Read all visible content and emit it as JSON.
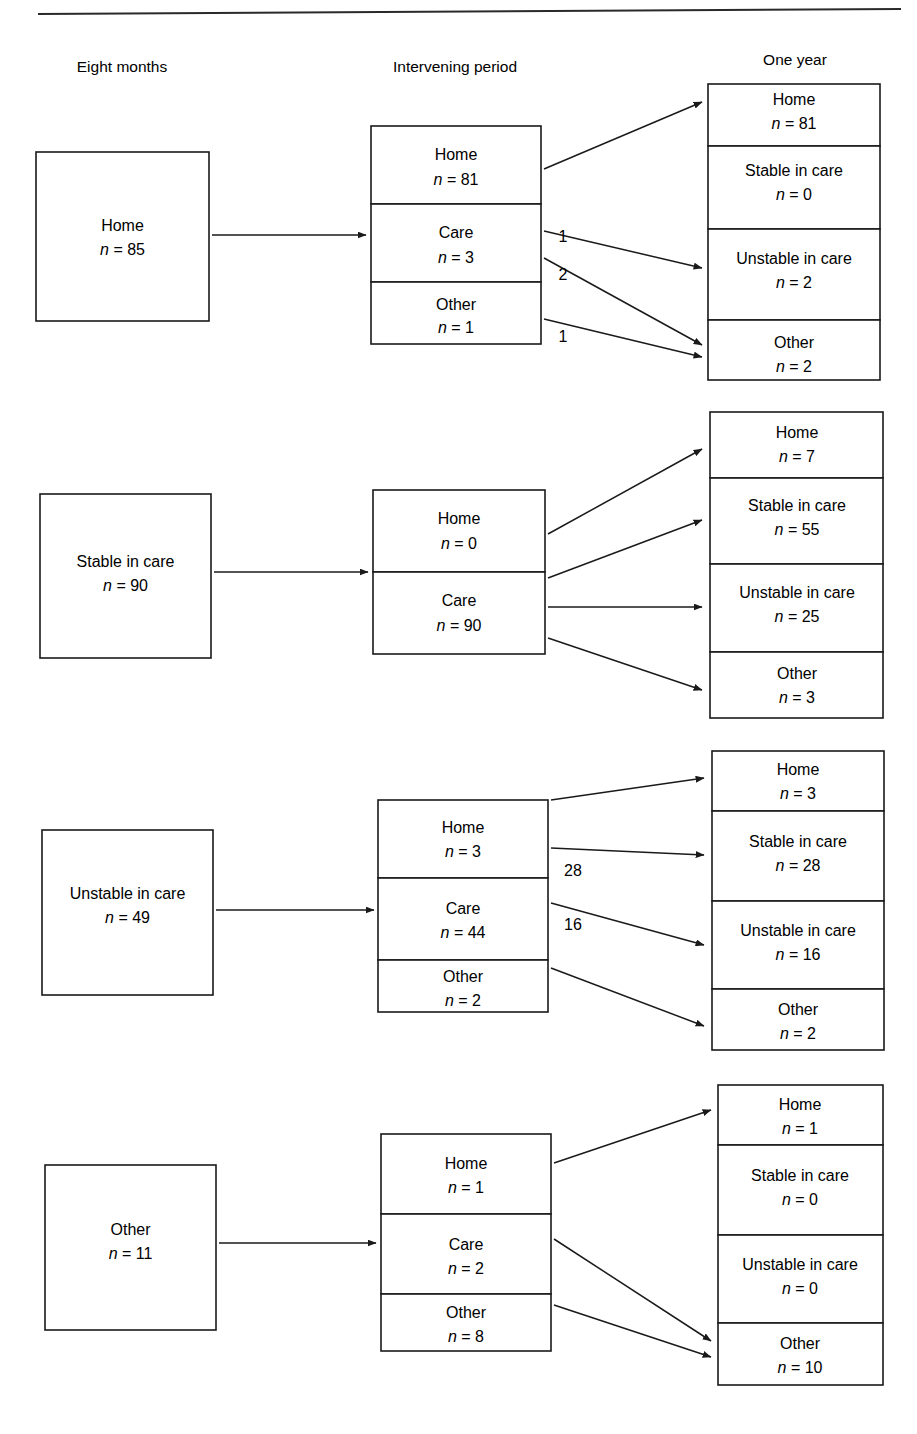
{
  "figure": {
    "type": "flow-diagram",
    "title": "",
    "top_rule": true
  },
  "columns": [
    {
      "id": "eight-months",
      "label": "Eight months",
      "x": 122
    },
    {
      "id": "intervening-period",
      "label": "Intervening period",
      "x": 455
    },
    {
      "id": "one-year",
      "label": "One year",
      "x": 795
    }
  ],
  "count_prefix": "n = ",
  "groups": [
    {
      "id": "group-home",
      "origin": {
        "label": "Home",
        "count": "85",
        "n": 85
      },
      "intervening": [
        {
          "label": "Home",
          "count": "81",
          "n": 81
        },
        {
          "label": "Care",
          "count": "3",
          "n": 3
        },
        {
          "label": "Other",
          "count": "1",
          "n": 1
        }
      ],
      "outcomes": [
        {
          "label": "Home",
          "count": "81",
          "n": 81
        },
        {
          "label": "Stable in care",
          "count": "0",
          "n": 0
        },
        {
          "label": "Unstable in care",
          "count": "2",
          "n": 2
        },
        {
          "label": "Other",
          "count": "2",
          "n": 2
        }
      ],
      "edge_labels": [
        "1",
        "2",
        "1"
      ],
      "flows": [
        {
          "from": "Home",
          "to": "Home",
          "value": 81,
          "label": ""
        },
        {
          "from": "Care",
          "to": "Unstable in care",
          "value": 1,
          "label": "1"
        },
        {
          "from": "Care",
          "to": "Other",
          "value": 2,
          "label": "2"
        },
        {
          "from": "Other",
          "to": "Other",
          "value": 1,
          "label": "1"
        }
      ]
    },
    {
      "id": "group-stable-in-care",
      "origin": {
        "label": "Stable in care",
        "count": "90",
        "n": 90
      },
      "intervening": [
        {
          "label": "Home",
          "count": "0",
          "n": 0
        },
        {
          "label": "Care",
          "count": "90",
          "n": 90
        }
      ],
      "outcomes": [
        {
          "label": "Home",
          "count": "7",
          "n": 7
        },
        {
          "label": "Stable in care",
          "count": "55",
          "n": 55
        },
        {
          "label": "Unstable in care",
          "count": "25",
          "n": 25
        },
        {
          "label": "Other",
          "count": "3",
          "n": 3
        }
      ],
      "edge_labels": [],
      "flows": [
        {
          "from": "Home",
          "to": "Home",
          "value": 7,
          "label": ""
        },
        {
          "from": "Care",
          "to": "Stable in care",
          "value": 55,
          "label": ""
        },
        {
          "from": "Care",
          "to": "Unstable in care",
          "value": 25,
          "label": ""
        },
        {
          "from": "Care",
          "to": "Other",
          "value": 3,
          "label": ""
        }
      ]
    },
    {
      "id": "group-unstable-in-care",
      "origin": {
        "label": "Unstable in care",
        "count": "49",
        "n": 49
      },
      "intervening": [
        {
          "label": "Home",
          "count": "3",
          "n": 3
        },
        {
          "label": "Care",
          "count": "44",
          "n": 44
        },
        {
          "label": "Other",
          "count": "2",
          "n": 2
        }
      ],
      "outcomes": [
        {
          "label": "Home",
          "count": "3",
          "n": 3
        },
        {
          "label": "Stable in care",
          "count": "28",
          "n": 28
        },
        {
          "label": "Unstable in care",
          "count": "16",
          "n": 16
        },
        {
          "label": "Other",
          "count": "2",
          "n": 2
        }
      ],
      "edge_labels": [
        "28",
        "16"
      ],
      "flows": [
        {
          "from": "Home",
          "to": "Home",
          "value": 3,
          "label": ""
        },
        {
          "from": "Home",
          "to": "Stable in care",
          "value": 28,
          "label": "28"
        },
        {
          "from": "Care",
          "to": "Unstable in care",
          "value": 16,
          "label": "16"
        },
        {
          "from": "Other",
          "to": "Other",
          "value": 2,
          "label": ""
        }
      ]
    },
    {
      "id": "group-other",
      "origin": {
        "label": "Other",
        "count": "11",
        "n": 11
      },
      "intervening": [
        {
          "label": "Home",
          "count": "1",
          "n": 1
        },
        {
          "label": "Care",
          "count": "2",
          "n": 2
        },
        {
          "label": "Other",
          "count": "8",
          "n": 8
        }
      ],
      "outcomes": [
        {
          "label": "Home",
          "count": "1",
          "n": 1
        },
        {
          "label": "Stable in care",
          "count": "0",
          "n": 0
        },
        {
          "label": "Unstable in care",
          "count": "0",
          "n": 0
        },
        {
          "label": "Other",
          "count": "10",
          "n": 10
        }
      ],
      "edge_labels": [],
      "flows": [
        {
          "from": "Home",
          "to": "Home",
          "value": 1,
          "label": ""
        },
        {
          "from": "Care",
          "to": "Other",
          "value": 2,
          "label": ""
        },
        {
          "from": "Other",
          "to": "Other",
          "value": 8,
          "label": ""
        }
      ]
    }
  ]
}
